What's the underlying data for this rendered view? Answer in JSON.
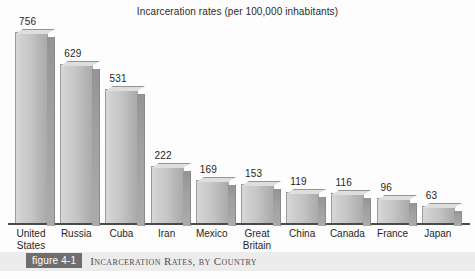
{
  "chart_data": {
    "type": "bar",
    "title": "Incarceration rates (per 100,000 inhabitants)",
    "xlabel": "",
    "ylabel": "",
    "ylim": [
      0,
      800
    ],
    "grid": false,
    "legend": null,
    "categories": [
      "United States",
      "Russia",
      "Cuba",
      "Iran",
      "Mexico",
      "Great Britain",
      "China",
      "Canada",
      "France",
      "Japan"
    ],
    "values": [
      756,
      629,
      531,
      222,
      169,
      153,
      119,
      116,
      96,
      63
    ],
    "value_labels": [
      "756",
      "629",
      "531",
      "222",
      "169",
      "153",
      "119",
      "116",
      "96",
      "63"
    ],
    "units": "per 100,000 inhabitants",
    "bar_style": "3d-block-grayscale"
  },
  "caption": {
    "figure_tag": "figure 4-1",
    "text": "Incarceration Rates, by Country"
  },
  "colors": {
    "bar_front_light": "#d8d8d8",
    "bar_front_dark": "#a9a9a9",
    "bar_side": "#9a9a9a",
    "axis": "#4a4a4a",
    "text": "#1f1f1f",
    "caption_tag_bg": "#6e6e6e",
    "caption_band_bg": "#ececec",
    "background": "#fdfdfd"
  }
}
